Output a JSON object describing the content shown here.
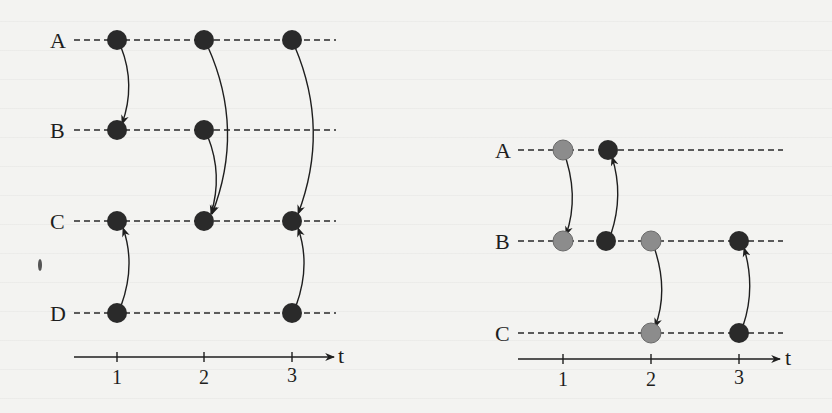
{
  "colors": {
    "background": "#f3f3f1",
    "dark_node": "#2a2a2a",
    "gray_node": "#8c8c8c",
    "line": "#1e1e1e"
  },
  "left_diagram": {
    "rows": [
      {
        "label": "A"
      },
      {
        "label": "B"
      },
      {
        "label": "C"
      },
      {
        "label": "D"
      }
    ],
    "axis": {
      "label": "t",
      "ticks": [
        "1",
        "2",
        "3"
      ]
    },
    "nodes": [
      {
        "row": "A",
        "t": 1,
        "color": "dark"
      },
      {
        "row": "A",
        "t": 2,
        "color": "dark"
      },
      {
        "row": "A",
        "t": 3,
        "color": "dark"
      },
      {
        "row": "B",
        "t": 1,
        "color": "dark"
      },
      {
        "row": "B",
        "t": 2,
        "color": "dark"
      },
      {
        "row": "C",
        "t": 1,
        "color": "dark"
      },
      {
        "row": "C",
        "t": 2,
        "color": "dark"
      },
      {
        "row": "C",
        "t": 3,
        "color": "dark"
      },
      {
        "row": "D",
        "t": 1,
        "color": "dark"
      },
      {
        "row": "D",
        "t": 3,
        "color": "dark"
      }
    ],
    "edges": [
      {
        "from": "A@1",
        "to": "B@1"
      },
      {
        "from": "A@2",
        "to": "C@2"
      },
      {
        "from": "B@2",
        "to": "C@2"
      },
      {
        "from": "A@3",
        "to": "C@3"
      },
      {
        "from": "D@1",
        "to": "C@1"
      },
      {
        "from": "D@3",
        "to": "C@3"
      }
    ]
  },
  "right_diagram": {
    "rows": [
      {
        "label": "A"
      },
      {
        "label": "B"
      },
      {
        "label": "C"
      }
    ],
    "axis": {
      "label": "t",
      "ticks": [
        "1",
        "2",
        "3"
      ]
    },
    "nodes": [
      {
        "row": "A",
        "t": 1,
        "color": "gray"
      },
      {
        "row": "A",
        "t": 1.5,
        "color": "dark"
      },
      {
        "row": "B",
        "t": 1,
        "color": "gray"
      },
      {
        "row": "B",
        "t": 1.5,
        "color": "dark"
      },
      {
        "row": "B",
        "t": 2,
        "color": "gray"
      },
      {
        "row": "B",
        "t": 3,
        "color": "dark"
      },
      {
        "row": "C",
        "t": 2,
        "color": "gray"
      },
      {
        "row": "C",
        "t": 3,
        "color": "dark"
      }
    ],
    "edges": [
      {
        "from": "A@1",
        "to": "B@1"
      },
      {
        "from": "B@1.5",
        "to": "A@1.5"
      },
      {
        "from": "B@2",
        "to": "C@2"
      },
      {
        "from": "C@3",
        "to": "B@3"
      }
    ]
  }
}
